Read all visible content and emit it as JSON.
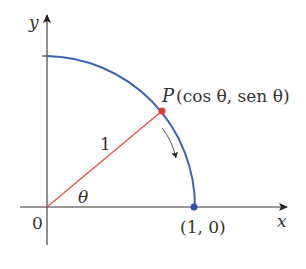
{
  "diagram": {
    "type": "unit-circle-quadrant",
    "colors": {
      "axis": "#333333",
      "arc": "#3f63b5",
      "radius": "#e8574e",
      "point_p": "#d84034",
      "point_10": "#2f4fa8",
      "text": "#333333"
    },
    "labels": {
      "y_axis": "y",
      "x_axis": "x",
      "origin": "0",
      "radius": "1",
      "angle": "θ",
      "point_p_name": "P",
      "point_p_coords": "(cos θ, sen θ)",
      "point_10": "(1, 0)"
    }
  }
}
